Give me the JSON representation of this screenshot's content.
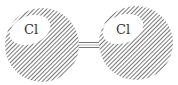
{
  "diagram": {
    "molecule": "Cl2",
    "atoms": [
      {
        "label": "Cl",
        "cx": 42,
        "cy": 45,
        "r": 37,
        "hx": 30,
        "hy": 30,
        "hrx": 21,
        "hry": 14,
        "tx": 31,
        "ty": 34
      },
      {
        "label": "Cl",
        "cx": 136,
        "cy": 43,
        "r": 37,
        "hx": 123,
        "hy": 29,
        "hrx": 21,
        "hry": 14,
        "tx": 120,
        "ty": 34
      }
    ],
    "bond": {
      "x1": 76,
      "x2": 101,
      "y": 45,
      "type": "single"
    },
    "colors": {
      "hatch": "#555555",
      "background": "#ffffff",
      "bond": "#777777"
    }
  }
}
